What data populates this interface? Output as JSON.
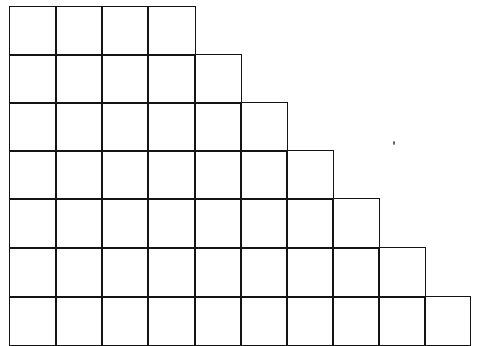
{
  "diagram": {
    "type": "staircase-grid",
    "line_color": "#141414",
    "background": "#ffffff",
    "column_x": [
      9,
      55,
      101,
      147,
      194,
      240,
      286,
      332,
      378,
      424,
      469
    ],
    "row_y": [
      6,
      54,
      102,
      150,
      198,
      247,
      296,
      344
    ],
    "cells_per_row": [
      4,
      5,
      6,
      7,
      8,
      9,
      10
    ]
  }
}
